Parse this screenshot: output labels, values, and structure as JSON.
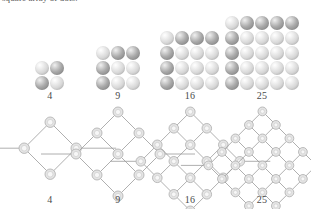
{
  "figure": {
    "caption_top": "square array of dots.",
    "dot_colors": {
      "light": "#d7d7d7",
      "dark": "#a9a9a9",
      "line": "#9a9a9a"
    },
    "top_row": {
      "name": "square-dot-arrays",
      "groups": [
        {
          "label": "4",
          "side": 2,
          "count": 4
        },
        {
          "label": "9",
          "side": 3,
          "count": 9
        },
        {
          "label": "16",
          "side": 4,
          "count": 16
        },
        {
          "label": "25",
          "side": 5,
          "count": 25
        }
      ]
    },
    "bottom_row": {
      "name": "rotated-square-lattices",
      "groups": [
        {
          "label": "4",
          "side": 2,
          "count": 4
        },
        {
          "label": "9",
          "side": 3,
          "count": 9
        },
        {
          "label": "16",
          "side": 4,
          "count": 16
        },
        {
          "label": "25",
          "side": 5,
          "count": 25
        }
      ]
    }
  }
}
